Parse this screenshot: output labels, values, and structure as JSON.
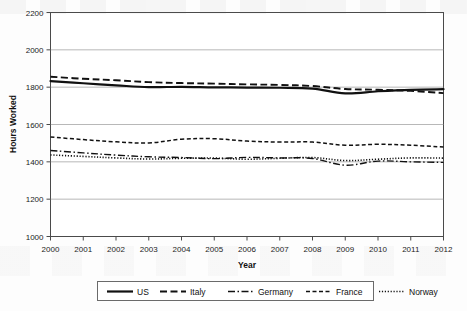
{
  "chart_data": {
    "type": "line",
    "title": "",
    "xlabel": "Year",
    "ylabel": "Hours Worked",
    "grid": true,
    "legend_position": "bottom",
    "x": [
      2000,
      2001,
      2002,
      2003,
      2004,
      2005,
      2006,
      2007,
      2008,
      2009,
      2010,
      2011,
      2012
    ],
    "xtick_labels": [
      "2000",
      "2001",
      "2002",
      "2003",
      "2004",
      "2005",
      "2006",
      "2007",
      "2008",
      "2009",
      "2010",
      "2011",
      "2012"
    ],
    "ytick_labels": [
      "1000",
      "1200",
      "1400",
      "1600",
      "1800",
      "2000",
      "2200"
    ],
    "ytick_values": [
      1000,
      1200,
      1400,
      1600,
      1800,
      2000,
      2200
    ],
    "xlim": [
      2000,
      2012
    ],
    "ylim": [
      1000,
      2200
    ],
    "series": [
      {
        "name": "US",
        "style": "solid",
        "values": [
          1832,
          1821,
          1810,
          1800,
          1802,
          1799,
          1798,
          1797,
          1792,
          1767,
          1778,
          1786,
          1789
        ]
      },
      {
        "name": "Italy",
        "style": "long-dash",
        "values": [
          1856,
          1845,
          1837,
          1827,
          1822,
          1819,
          1815,
          1812,
          1806,
          1790,
          1786,
          1780,
          1768
        ]
      },
      {
        "name": "Germany",
        "style": "dash-dot",
        "values": [
          1461,
          1448,
          1436,
          1427,
          1423,
          1417,
          1424,
          1421,
          1418,
          1382,
          1404,
          1400,
          1397
        ]
      },
      {
        "name": "France",
        "style": "dashed",
        "values": [
          1533,
          1519,
          1507,
          1501,
          1521,
          1524,
          1511,
          1506,
          1506,
          1489,
          1494,
          1489,
          1479
        ]
      },
      {
        "name": "Norway",
        "style": "dotted",
        "values": [
          1437,
          1429,
          1421,
          1415,
          1419,
          1420,
          1414,
          1419,
          1423,
          1407,
          1414,
          1421,
          1420
        ]
      }
    ]
  },
  "legend": {
    "items": [
      {
        "label": "US",
        "style": "solid"
      },
      {
        "label": "Italy",
        "style": "long-dash"
      },
      {
        "label": "Germany",
        "style": "dash-dot"
      },
      {
        "label": "France",
        "style": "dashed"
      },
      {
        "label": "Norway",
        "style": "dotted"
      }
    ]
  },
  "colors": {
    "ink": "#111111",
    "grid": "#9a9a9a",
    "border": "#4a4a4a",
    "background": "#fdfdfd"
  }
}
